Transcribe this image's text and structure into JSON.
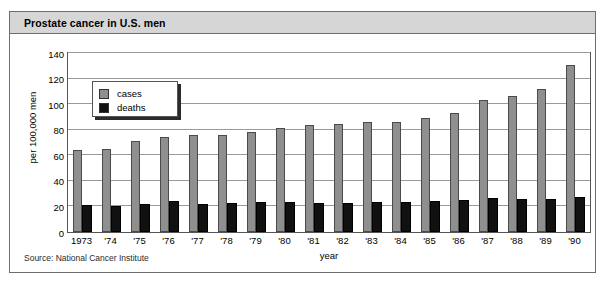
{
  "figure": {
    "title": "Prostate cancer in U.S. men",
    "source_note": "Source: National Cancer Institute"
  },
  "legend": {
    "position": "top-left-inside-plot",
    "entries": [
      {
        "label": "cases",
        "color": "#8f8f8f",
        "swatch_icon": "gray-square-icon"
      },
      {
        "label": "deaths",
        "color": "#111111",
        "swatch_icon": "black-square-icon"
      }
    ]
  },
  "chart_data": {
    "type": "bar",
    "title": "Prostate cancer in U.S. men",
    "subtitle": "",
    "xlabel": "year",
    "ylabel": "per 100,000 men",
    "ylim": [
      0,
      140
    ],
    "yticks": [
      0,
      20,
      40,
      60,
      80,
      100,
      120,
      140
    ],
    "ytick_labels": [
      "0",
      "20",
      "40",
      "60",
      "80",
      "100",
      "120",
      "140"
    ],
    "grid": true,
    "grid_axis": "y",
    "legend": [
      "cases",
      "deaths"
    ],
    "legend_position": "upper left",
    "categories": [
      "1973",
      "'74",
      "'75",
      "'76",
      "'77",
      "'78",
      "'79",
      "'80",
      "'81",
      "'82",
      "'83",
      "'84",
      "'85",
      "'86",
      "'87",
      "'88",
      "'89",
      "'90"
    ],
    "series": [
      {
        "name": "cases",
        "color": "#8f8f8f",
        "values": [
          64,
          65,
          71,
          74,
          76,
          75.5,
          78,
          81,
          84,
          84.5,
          86,
          86,
          89,
          93,
          103,
          106,
          112,
          131
        ]
      },
      {
        "name": "deaths",
        "color": "#111111",
        "values": [
          21.5,
          20.5,
          22,
          24,
          22,
          23,
          23.5,
          23.5,
          23,
          23,
          23.5,
          23.5,
          24.5,
          25,
          26.5,
          25.5,
          26,
          27
        ]
      }
    ],
    "annotations": [
      "Source: National Cancer Institute"
    ]
  }
}
